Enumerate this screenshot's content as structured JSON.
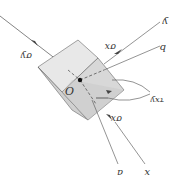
{
  "diagram": {
    "point_label": "O",
    "labels": {
      "sigma_y": "σy",
      "sigma_x_top": "σx",
      "axis_y": "y",
      "axis_b": "b",
      "tau": "τxy",
      "sigma_x_bottom": "σx",
      "axis_a": "a",
      "axis_x": "x"
    },
    "colors": {
      "face_light": "#e6e6e6",
      "face_mid": "#d2d2d2",
      "face_dark": "#c4c4c4",
      "stroke": "#555555",
      "line": "#666666"
    }
  }
}
